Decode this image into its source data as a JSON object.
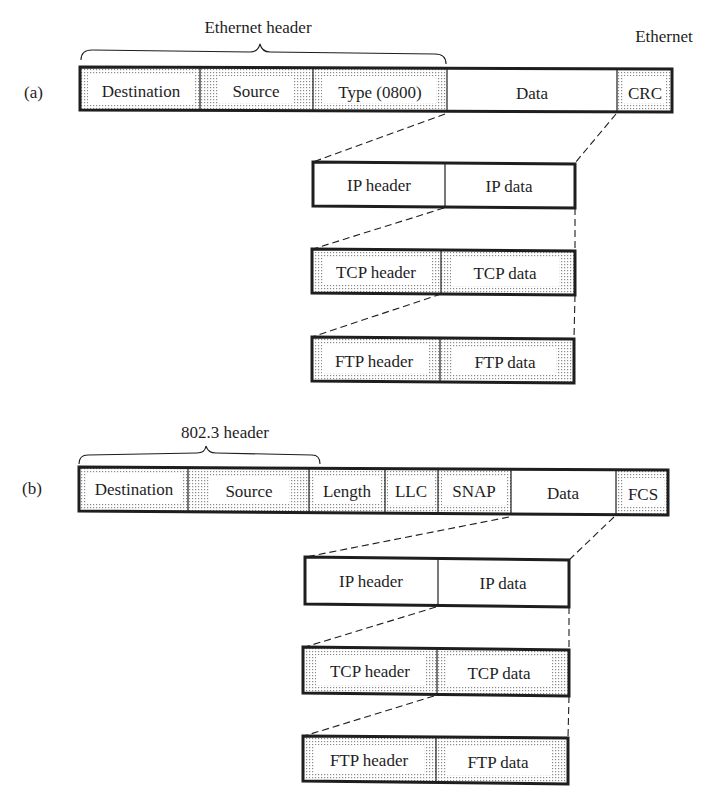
{
  "figure": {
    "part_a": {
      "label": "(a)",
      "header_caption": "Ethernet header",
      "trailer_caption": "Ethernet",
      "frame": {
        "fields": [
          {
            "name": "destination",
            "label": "Destination",
            "shaded": true
          },
          {
            "name": "source",
            "label": "Source",
            "shaded": true
          },
          {
            "name": "type",
            "label": "Type (0800)",
            "shaded": true
          },
          {
            "name": "data",
            "label": "Data",
            "shaded": false
          },
          {
            "name": "crc",
            "label": "CRC",
            "shaded": true
          }
        ]
      },
      "ip": {
        "header": "IP header",
        "data": "IP data",
        "shaded": false
      },
      "tcp": {
        "header": "TCP header",
        "data": "TCP data",
        "shaded": true
      },
      "ftp": {
        "header": "FTP header",
        "data": "FTP data",
        "shaded": true
      }
    },
    "part_b": {
      "label": "(b)",
      "header_caption": "802.3 header",
      "frame": {
        "fields": [
          {
            "name": "destination",
            "label": "Destination",
            "shaded": true
          },
          {
            "name": "source",
            "label": "Source",
            "shaded": true
          },
          {
            "name": "length",
            "label": "Length",
            "shaded": true
          },
          {
            "name": "llc",
            "label": "LLC",
            "shaded": true
          },
          {
            "name": "snap",
            "label": "SNAP",
            "shaded": true
          },
          {
            "name": "data",
            "label": "Data",
            "shaded": false
          },
          {
            "name": "fcs",
            "label": "FCS",
            "shaded": true
          }
        ]
      },
      "ip": {
        "header": "IP header",
        "data": "IP data",
        "shaded": false
      },
      "tcp": {
        "header": "TCP header",
        "data": "TCP data",
        "shaded": true
      },
      "ftp": {
        "header": "FTP header",
        "data": "FTP data",
        "shaded": true
      }
    },
    "colors": {
      "ink": "#1e1e1e",
      "dot": "#8a8a8a",
      "background": "#ffffff"
    }
  }
}
